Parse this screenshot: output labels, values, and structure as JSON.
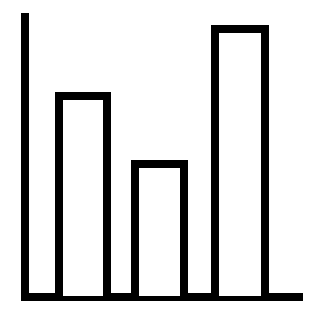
{
  "chart_data": {
    "type": "bar",
    "title": "",
    "xlabel": "",
    "ylabel": "",
    "categories": [
      "",
      "",
      ""
    ],
    "values": [
      204,
      136,
      271
    ],
    "ylim": [
      0,
      290
    ],
    "grid": false,
    "legend": null,
    "style": {
      "stroke": "#000000",
      "fill": "#ffffff",
      "background": "#ffffff"
    },
    "layout": {
      "origin": [
        21,
        300
      ],
      "y_axis_top": 13,
      "x_axis_right": 303,
      "bars_x": [
        [
          55,
          111
        ],
        [
          131,
          188
        ],
        [
          211,
          269
        ]
      ],
      "baseline_y": 296
    }
  }
}
